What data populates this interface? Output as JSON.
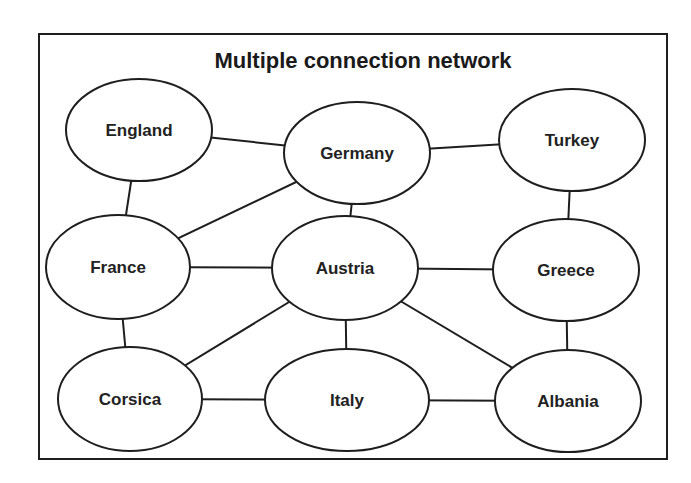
{
  "title": "Multiple connection network",
  "colors": {
    "stroke": "#1e1e1e",
    "fill": "#ffffff",
    "text": "#222222"
  },
  "nodes": [
    {
      "id": "england",
      "label": "England",
      "cx": 139,
      "cy": 130,
      "rx": 73,
      "ry": 51
    },
    {
      "id": "germany",
      "label": "Germany",
      "cx": 357,
      "cy": 153,
      "rx": 73,
      "ry": 51
    },
    {
      "id": "turkey",
      "label": "Turkey",
      "cx": 572,
      "cy": 140,
      "rx": 73,
      "ry": 51
    },
    {
      "id": "france",
      "label": "France",
      "cx": 118,
      "cy": 267,
      "rx": 72,
      "ry": 52
    },
    {
      "id": "austria",
      "label": "Austria",
      "cx": 345,
      "cy": 268,
      "rx": 73,
      "ry": 52
    },
    {
      "id": "greece",
      "label": "Greece",
      "cx": 566,
      "cy": 270,
      "rx": 73,
      "ry": 51
    },
    {
      "id": "corsica",
      "label": "Corsica",
      "cx": 130,
      "cy": 399,
      "rx": 72,
      "ry": 52
    },
    {
      "id": "italy",
      "label": "Italy",
      "cx": 347,
      "cy": 400,
      "rx": 82,
      "ry": 51
    },
    {
      "id": "albania",
      "label": "Albania",
      "cx": 568,
      "cy": 401,
      "rx": 73,
      "ry": 51
    }
  ],
  "edges": [
    {
      "from": "england",
      "to": "germany",
      "x1": 180,
      "y1": 128,
      "x2": 236,
      "y2": 150
    },
    {
      "from": "england",
      "to": "france",
      "x1": 118,
      "y1": 179,
      "x2": 101,
      "y2": 215
    },
    {
      "from": "germany",
      "to": "turkey",
      "x1": 358,
      "y1": 152,
      "x2": 413,
      "y2": 140
    },
    {
      "from": "germany",
      "to": "france",
      "x1": 240,
      "y1": 175,
      "x2": 155,
      "y2": 242
    },
    {
      "from": "germany",
      "to": "austria",
      "x1": 294,
      "y1": 203,
      "x2": 287,
      "y2": 215
    },
    {
      "from": "turkey",
      "to": "greece",
      "x1": 473,
      "y1": 190,
      "x2": 469,
      "y2": 218
    },
    {
      "from": "france",
      "to": "austria",
      "x1": 161,
      "y1": 266,
      "x2": 226,
      "y2": 266
    },
    {
      "from": "france",
      "to": "corsica",
      "x1": 101,
      "y1": 317,
      "x2": 112,
      "y2": 347
    },
    {
      "from": "austria",
      "to": "greece",
      "x1": 344,
      "y1": 268,
      "x2": 408,
      "y2": 268
    },
    {
      "from": "austria",
      "to": "corsica",
      "x1": 241,
      "y1": 304,
      "x2": 157,
      "y2": 358
    },
    {
      "from": "austria",
      "to": "italy",
      "x1": 286,
      "y1": 318,
      "x2": 291,
      "y2": 347
    },
    {
      "from": "austria",
      "to": "albania",
      "x1": 331,
      "y1": 305,
      "x2": 419,
      "y2": 362
    },
    {
      "from": "greece",
      "to": "albania",
      "x1": 467,
      "y1": 320,
      "x2": 462,
      "y2": 349
    },
    {
      "from": "corsica",
      "to": "italy",
      "x1": 172,
      "y1": 398,
      "x2": 223,
      "y2": 398
    },
    {
      "from": "italy",
      "to": "albania",
      "x1": 361,
      "y1": 400,
      "x2": 403,
      "y2": 400
    }
  ]
}
